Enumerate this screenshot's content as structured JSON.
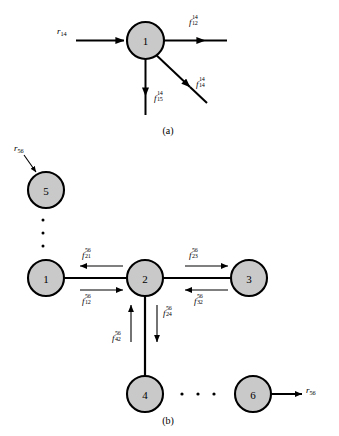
{
  "figure": {
    "panel_a": {
      "caption": "(a)",
      "node": {
        "id": "node-1",
        "label": "1"
      },
      "input_flow": {
        "base": "r",
        "sub": "14"
      },
      "output_flows": [
        {
          "name": "flow-1-to-12",
          "base": "f",
          "sup": "14",
          "sub": "12",
          "direction": "right"
        },
        {
          "name": "flow-1-to-14",
          "base": "f",
          "sup": "14",
          "sub": "14",
          "direction": "diagonal-down-right"
        },
        {
          "name": "flow-1-to-15",
          "base": "f",
          "sup": "14",
          "sub": "15",
          "direction": "down"
        }
      ]
    },
    "panel_b": {
      "caption": "(b)",
      "nodes": [
        {
          "name": "node-5",
          "label": "5"
        },
        {
          "name": "node-1",
          "label": "1"
        },
        {
          "name": "node-2",
          "label": "2"
        },
        {
          "name": "node-3",
          "label": "3"
        },
        {
          "name": "node-4",
          "label": "4"
        },
        {
          "name": "node-6",
          "label": "6"
        }
      ],
      "external_flows": [
        {
          "name": "inflow-r56-node5",
          "base": "r",
          "sub": "56",
          "direction": "into-node-5"
        },
        {
          "name": "outflow-r56-node6",
          "base": "r",
          "sub": "56",
          "direction": "out-of-node-6"
        }
      ],
      "internal_flows": [
        {
          "name": "flow-21",
          "base": "f",
          "sup": "56",
          "sub": "21",
          "direction": "left"
        },
        {
          "name": "flow-12",
          "base": "f",
          "sup": "56",
          "sub": "12",
          "direction": "right"
        },
        {
          "name": "flow-23",
          "base": "f",
          "sup": "56",
          "sub": "23",
          "direction": "right"
        },
        {
          "name": "flow-32",
          "base": "f",
          "sup": "56",
          "sub": "32",
          "direction": "left"
        },
        {
          "name": "flow-42",
          "base": "f",
          "sup": "56",
          "sub": "42",
          "direction": "up"
        },
        {
          "name": "flow-24",
          "base": "f",
          "sup": "56",
          "sub": "24",
          "direction": "down"
        }
      ],
      "ellipsis_vertical": "⋮",
      "ellipsis_horizontal": "⋯"
    },
    "colors": {
      "node_fill": "#c9c9c9",
      "stroke": "#000000",
      "background": "#ffffff"
    }
  }
}
